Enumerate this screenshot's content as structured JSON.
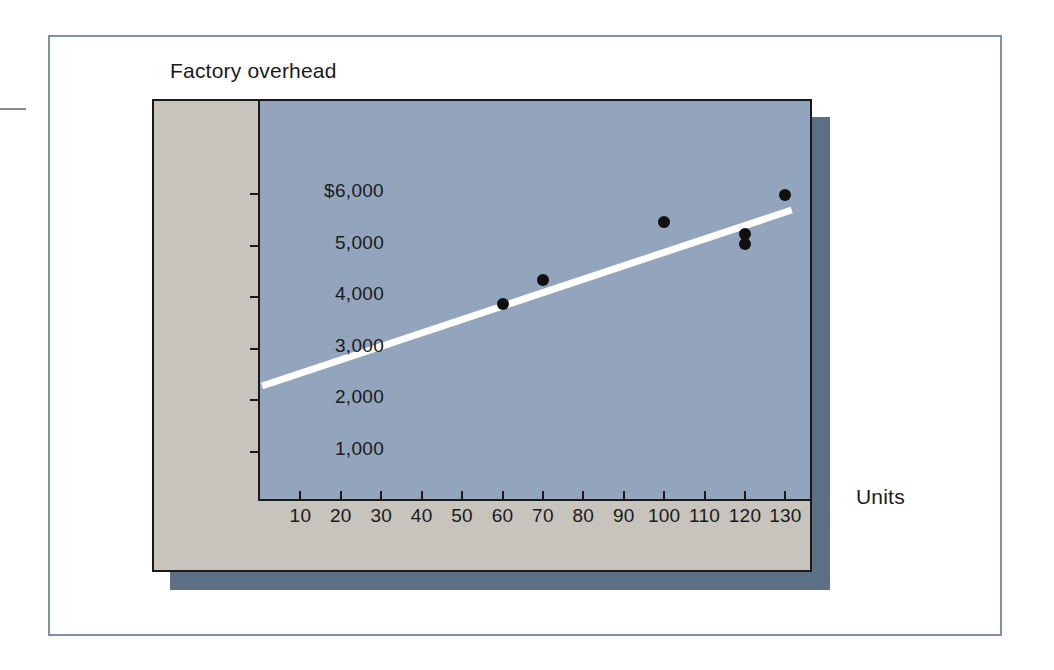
{
  "chart_data": {
    "type": "scatter",
    "title": "Factory overhead",
    "xlabel": "Units",
    "ylabel": "Factory overhead",
    "xlim": [
      0,
      134
    ],
    "ylim": [
      0,
      6500
    ],
    "grid": false,
    "legend": "none",
    "x_ticks": [
      10,
      20,
      30,
      40,
      50,
      60,
      70,
      80,
      90,
      100,
      110,
      120,
      130
    ],
    "x_tick_labels": [
      "10",
      "20",
      "30",
      "40",
      "50",
      "60",
      "70",
      "80",
      "90",
      "100",
      "110",
      "120",
      "130"
    ],
    "y_ticks": [
      1000,
      2000,
      3000,
      4000,
      5000,
      6000
    ],
    "y_tick_labels": [
      "1,000",
      "2,000",
      "3,000",
      "4,000",
      "5,000",
      "$6,000"
    ],
    "series": [
      {
        "name": "Observed overhead",
        "marker": "filled-circle",
        "color": "#101010",
        "points": [
          {
            "x": 60,
            "y": 3870
          },
          {
            "x": 70,
            "y": 4330
          },
          {
            "x": 100,
            "y": 5450
          },
          {
            "x": 120,
            "y": 5220
          },
          {
            "x": 120,
            "y": 5030
          },
          {
            "x": 130,
            "y": 5980
          }
        ]
      },
      {
        "name": "Regression line",
        "type": "line",
        "color": "#ffffff",
        "points": [
          {
            "x": 0,
            "y": 2280
          },
          {
            "x": 132,
            "y": 5690
          }
        ]
      }
    ]
  },
  "colors": {
    "plot_background": "#92a5bd",
    "panel_background": "#c6c4bd",
    "block_shadow": "#5d6f85",
    "axis": "#1a1a1a",
    "marker": "#101010",
    "trend_line": "#ffffff",
    "outer_frame": "#7e90ad",
    "page_background": "#ffffff"
  }
}
